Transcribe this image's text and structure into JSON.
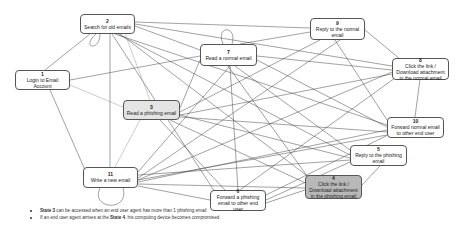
{
  "diagram": {
    "nodes": [
      {
        "id": "1",
        "label": "Login to Email Account"
      },
      {
        "id": "2",
        "label": "Search for old emails"
      },
      {
        "id": "3",
        "label": "Read a phishing email"
      },
      {
        "id": "4",
        "label": "Click the link / Download attachment in the phishing email"
      },
      {
        "id": "5",
        "label": "Reply to the phishing email"
      },
      {
        "id": "6",
        "label": "Forward a phishing email to other end user"
      },
      {
        "id": "7",
        "label": "Read a normal email"
      },
      {
        "id": "8",
        "label": "Click the link / Download attachment in the normal email"
      },
      {
        "id": "9",
        "label": "Reply to the normal email"
      },
      {
        "id": "10",
        "label": "Forward normal email to other end user"
      },
      {
        "id": "11",
        "label": "Write a new email"
      }
    ],
    "colors": {
      "edge": "#444444",
      "node_border": "#555555",
      "node_fill": "#ffffff",
      "phishing_read_fill": "#e4e4e4",
      "compromised_fill": "#b8b8b8"
    }
  },
  "notes": [
    {
      "bold": "State 3",
      "text": " can be accessed when an end user agent has more than 1 phishing email"
    },
    {
      "prefix": "If an end user agent arrives at the ",
      "bold": "State 4",
      "text": ", his computing device becomes compromised"
    }
  ]
}
